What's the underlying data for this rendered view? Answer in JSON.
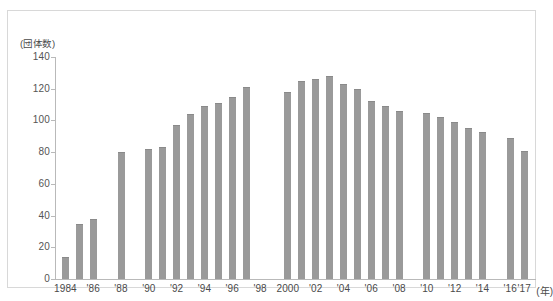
{
  "chart_data": {
    "type": "bar",
    "title": "",
    "xlabel": "年",
    "ylabel": "団体数",
    "unit_label": "(団体数)",
    "year_axis_suffix": "(年)",
    "ylim": [
      0,
      140
    ],
    "ytick_values": [
      0,
      20,
      40,
      60,
      80,
      100,
      120,
      140
    ],
    "ytick_labels": [
      "0",
      "20",
      "40",
      "60",
      "80",
      "100",
      "120",
      "140"
    ],
    "grid": false,
    "legend": "none",
    "bar_color": "#9a9a9a",
    "axis_color": "#b9b9b9",
    "categories": [
      "1984",
      "1985",
      "1986",
      "1987",
      "1988",
      "1989",
      "1990",
      "1991",
      "1992",
      "1993",
      "1994",
      "1995",
      "1996",
      "1997",
      "1998",
      "1999",
      "2000",
      "2001",
      "2002",
      "2003",
      "2004",
      "2005",
      "2006",
      "2007",
      "2008",
      "2009",
      "2010",
      "2011",
      "2012",
      "2013",
      "2014",
      "2015",
      "2016",
      "2017"
    ],
    "values": [
      14,
      35,
      38,
      null,
      80,
      null,
      82,
      83,
      97,
      104,
      109,
      111,
      115,
      121,
      null,
      null,
      118,
      125,
      126,
      128,
      123,
      120,
      112,
      109,
      106,
      null,
      105,
      102,
      99,
      95,
      93,
      null,
      89,
      81
    ],
    "xtick_labels": [
      {
        "category": "1984",
        "label": "1984"
      },
      {
        "category": "1986",
        "label": "'86"
      },
      {
        "category": "1988",
        "label": "'88"
      },
      {
        "category": "1990",
        "label": "'90"
      },
      {
        "category": "1992",
        "label": "'92"
      },
      {
        "category": "1994",
        "label": "'94"
      },
      {
        "category": "1996",
        "label": "'96"
      },
      {
        "category": "1998",
        "label": "'98"
      },
      {
        "category": "2000",
        "label": "2000"
      },
      {
        "category": "2002",
        "label": "'02"
      },
      {
        "category": "2004",
        "label": "'04"
      },
      {
        "category": "2006",
        "label": "'06"
      },
      {
        "category": "2008",
        "label": "'08"
      },
      {
        "category": "2010",
        "label": "'10"
      },
      {
        "category": "2012",
        "label": "'12"
      },
      {
        "category": "2014",
        "label": "'14"
      },
      {
        "category": "2016",
        "label": "'16"
      },
      {
        "category": "2017",
        "label": "'17"
      }
    ]
  },
  "caption": ""
}
